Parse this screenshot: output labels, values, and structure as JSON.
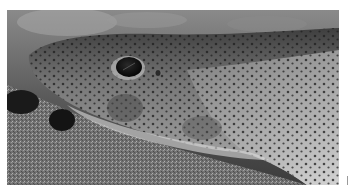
{
  "image": {
    "subject": "Spotted catshark resting on sandy seabed",
    "description": "Grayscale close-up photograph of a small-spotted catshark head with dark eye, spotted skin, lying on coarse sand",
    "palette": {
      "background": "#ffffff",
      "sand_light": "#9c9c9c",
      "sand_dark": "#3a3a3a",
      "skin_top": "#4a4a4a",
      "skin_mid": "#8a8a8a",
      "belly": "#cfcfcf",
      "spots": "#1e1e1e",
      "eye": "#0b0b0b",
      "edge_mark": "#9a9a9a"
    }
  }
}
